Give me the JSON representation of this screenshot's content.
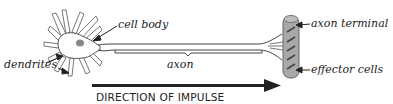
{
  "diagram": {
    "labels": {
      "cell_body": "cell body",
      "dendrites": "dendrites",
      "axon": "axon",
      "axon_terminal": "axon terminal",
      "effector_cells": "effector cells"
    },
    "direction_label": "DIRECTION OF IMPULSE",
    "colors": {
      "line": "#333333",
      "effector_fill": "#a8a8a8",
      "nucleus": "#888888",
      "arrow": "#222222"
    }
  }
}
